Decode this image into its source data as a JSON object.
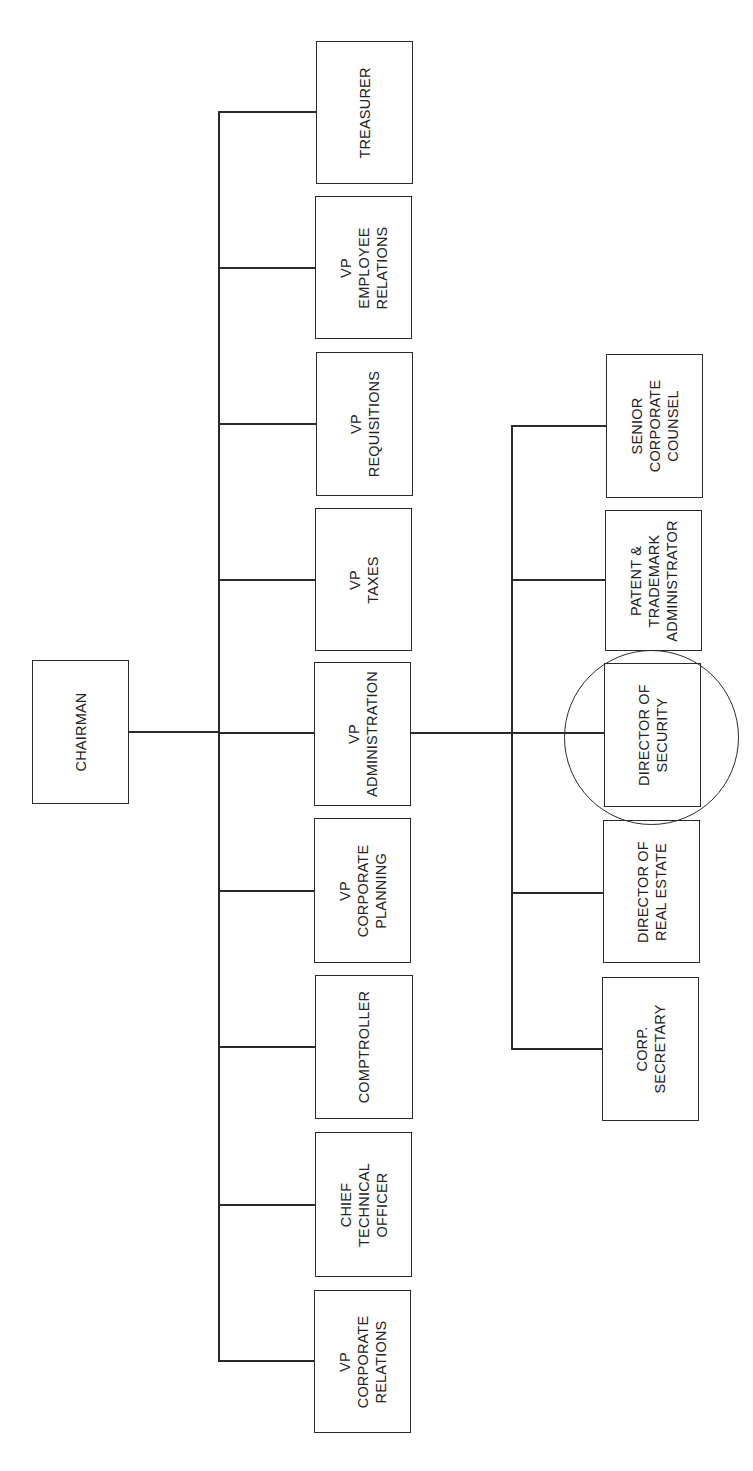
{
  "chart": {
    "type": "org-chart",
    "orientation": "rotated-90-ccw",
    "root": {
      "title": "CHAIRMAN"
    },
    "direct_reports": [
      {
        "id": "treasurer",
        "title": "TREASURER"
      },
      {
        "id": "vp-employee-relations",
        "title": "VP\nEMPLOYEE\nRELATIONS"
      },
      {
        "id": "vp-requisitions",
        "title": "VP\nREQUISITIONS"
      },
      {
        "id": "vp-taxes",
        "title": "VP\nTAXES"
      },
      {
        "id": "vp-administration",
        "title": "VP\nADMINISTRATION"
      },
      {
        "id": "vp-corporate-planning",
        "title": "VP\nCORPORATE\nPLANNING"
      },
      {
        "id": "comptroller",
        "title": "COMPTROLLER"
      },
      {
        "id": "chief-technical-officer",
        "title": "CHIEF\nTECHNICAL\nOFFICER"
      },
      {
        "id": "vp-corporate-relations",
        "title": "VP\nCORPORATE\nRELATIONS"
      }
    ],
    "vp_administration_reports": [
      {
        "id": "senior-corporate-counsel",
        "title": "SENIOR\nCORPORATE\nCOUNSEL"
      },
      {
        "id": "patent-trademark-administrator",
        "title": "PATENT &\nTRADEMARK\nADMINISTRATOR"
      },
      {
        "id": "director-of-security",
        "title": "DIRECTOR OF\nSECURITY",
        "highlighted": true
      },
      {
        "id": "director-of-real-estate",
        "title": "DIRECTOR OF\nREAL ESTATE"
      },
      {
        "id": "corp-secretary",
        "title": "CORP.\nSECRETARY"
      }
    ],
    "highlight": {
      "target": "DIRECTOR OF SECURITY",
      "shape": "circle"
    },
    "colors": {
      "line": "#2a2a2a",
      "background": "#ffffff",
      "text": "#222222"
    }
  }
}
